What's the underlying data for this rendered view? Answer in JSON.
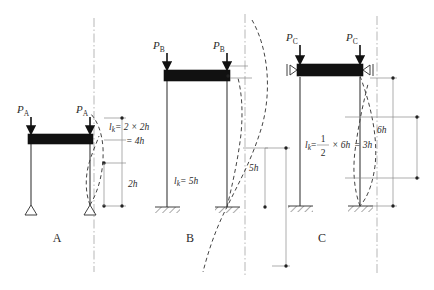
{
  "figure": {
    "background": "#ffffff",
    "ink": "#2b2b2b",
    "beam_color": "#111111",
    "dash_color": "#444444",
    "centerline_color": "#9a9a9a"
  },
  "panels": [
    {
      "id": "A",
      "letter": "A",
      "load_label": "P",
      "load_subscript": "A",
      "base_support": "pinned",
      "beam_support": "rigid",
      "formula_line1": "= 2 × 2h",
      "formula_line2": "= 4h",
      "formula_symbol": "l",
      "formula_symbol_sub": "k",
      "dim_label": "2h",
      "effective_length": "4h",
      "multiplier": "2",
      "story_height": "2h"
    },
    {
      "id": "B",
      "letter": "B",
      "load_label": "P",
      "load_subscript": "B",
      "base_support": "fixed",
      "beam_support": "rigid",
      "formula_symbol": "l",
      "formula_symbol_sub": "k",
      "formula_line1": "= 5h",
      "dim_label": "5h",
      "effective_length": "5h",
      "story_height": "2h"
    },
    {
      "id": "C",
      "letter": "C",
      "load_label": "P",
      "load_subscript": "C",
      "base_support": "fixed",
      "beam_support": "roller",
      "formula_symbol": "l",
      "formula_symbol_sub": "k",
      "formula_numerator": "1",
      "formula_denominator": "2",
      "formula_mid": "× 6h",
      "formula_tail": "= 3h",
      "dim_label": "6h",
      "effective_length": "3h",
      "story_height": "6h"
    }
  ]
}
